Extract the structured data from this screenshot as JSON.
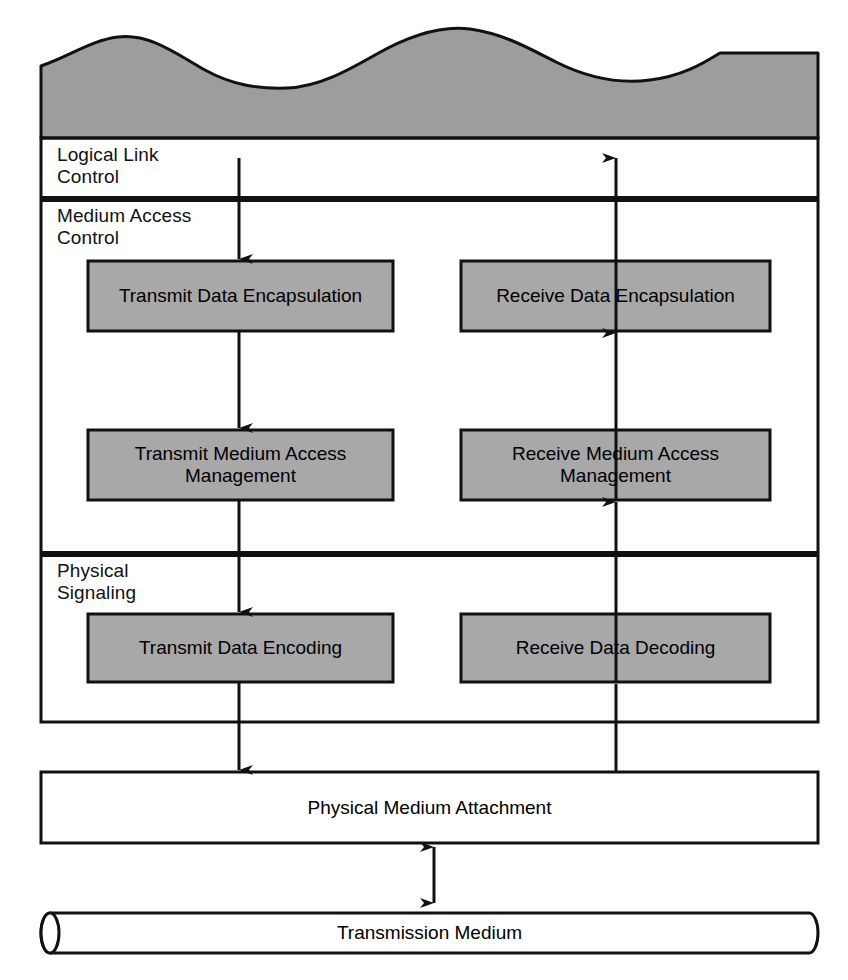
{
  "diagram": {
    "colors": {
      "shaded_fill": "#9d9d9d",
      "box_fill": "#a8a8a8",
      "stroke": "#111111",
      "background": "#ffffff"
    },
    "upper_shape": {
      "name": "upper-layers-wave",
      "description": "shaded wavy-topped block representing higher layers"
    },
    "layers": [
      {
        "id": "llc",
        "label": "Logical Link\nControl",
        "blocks": []
      },
      {
        "id": "mac",
        "label": "Medium Access\nControl",
        "blocks": [
          {
            "id": "transmit-data-encapsulation",
            "label": "Transmit Data\nEncapsulation",
            "column": "left"
          },
          {
            "id": "receive-data-encapsulation",
            "label": "Receive Data\nEncapsulation",
            "column": "right"
          },
          {
            "id": "transmit-medium-access-management",
            "label": "Transmit Medium\nAccess Management",
            "column": "left"
          },
          {
            "id": "receive-medium-access-management",
            "label": "Receive Medium\nAccess Management",
            "column": "right"
          }
        ]
      },
      {
        "id": "physical-signaling",
        "label": "Physical\nSignaling",
        "blocks": [
          {
            "id": "transmit-data-encoding",
            "label": "Transmit Data\nEncoding",
            "column": "left"
          },
          {
            "id": "receive-data-decoding",
            "label": "Receive Data\nDecoding",
            "column": "right"
          }
        ]
      }
    ],
    "lower_blocks": [
      {
        "id": "physical-medium-attachment",
        "label": "Physical Medium Attachment",
        "shape": "rectangle"
      },
      {
        "id": "transmission-medium",
        "label": "Transmission Medium",
        "shape": "cylinder"
      }
    ],
    "arrows": [
      {
        "id": "llc-to-transmit-encapsulation",
        "direction": "down",
        "column": "left"
      },
      {
        "id": "transmit-encapsulation-to-transmit-mam",
        "direction": "down",
        "column": "left"
      },
      {
        "id": "transmit-mam-to-transmit-encoding",
        "direction": "down",
        "column": "left"
      },
      {
        "id": "transmit-encoding-to-pma",
        "direction": "down",
        "column": "left"
      },
      {
        "id": "receive-encapsulation-to-llc",
        "direction": "up",
        "column": "right"
      },
      {
        "id": "receive-mam-to-receive-encapsulation",
        "direction": "up",
        "column": "right"
      },
      {
        "id": "receive-decoding-to-receive-mam",
        "direction": "up",
        "column": "right"
      },
      {
        "id": "pma-to-receive-decoding",
        "direction": "up",
        "column": "right"
      },
      {
        "id": "pma-to-transmission-medium",
        "direction": "both",
        "column": "center"
      }
    ]
  }
}
